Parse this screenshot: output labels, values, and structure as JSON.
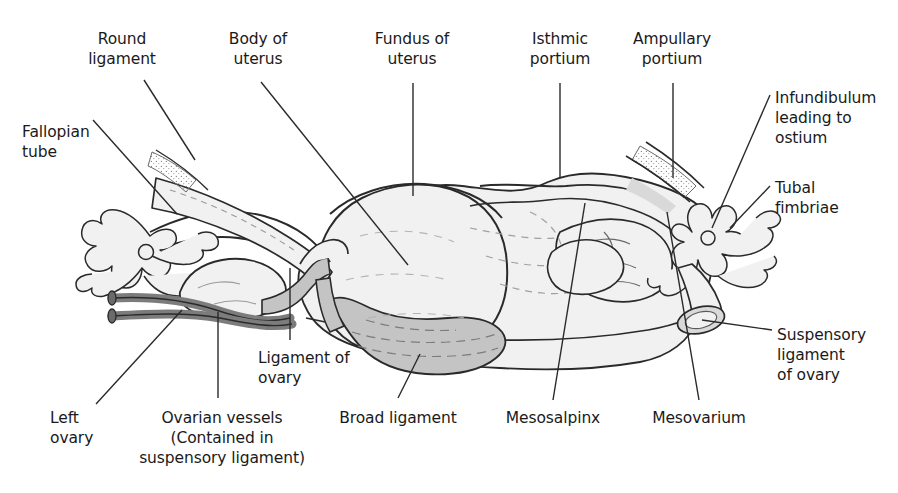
{
  "figure": {
    "background_color": "#ffffff",
    "ink_color": "#1a1a1a",
    "fills": {
      "organ_light": "#f1f1f1",
      "ligament_gray": "#c4c4c4",
      "vessel_dark": "#7c7c7c",
      "shade_mid": "#d9d9d9"
    }
  },
  "labels": {
    "round_ligament": "Round\nligament",
    "body_of_uterus": "Body of\nuterus",
    "fundus_of_uterus": "Fundus of\nuterus",
    "isthmic_portium": "Isthmic\nportium",
    "ampullary_portium": "Ampullary\nportium",
    "fallopian_tube": "Fallopian\ntube",
    "infundibulum": "Infundibulum\nleading to\nostium",
    "tubal_fimbriae": "Tubal\nfimbriae",
    "suspensory_ligament_of_ovary": "Suspensory\nligament\nof ovary",
    "ligament_of_ovary": "Ligament of\novary",
    "left_ovary": "Left\novary",
    "ovarian_vessels": "Ovarian vessels\n(Contained in\nsuspensory ligament)",
    "broad_ligament": "Broad ligament",
    "mesosalpinx": "Mesosalpinx",
    "mesovarium": "Mesovarium"
  },
  "label_positions": {
    "round_ligament": {
      "x": 122,
      "y": 29,
      "align": "center"
    },
    "body_of_uterus": {
      "x": 258,
      "y": 29,
      "align": "center"
    },
    "fundus_of_uterus": {
      "x": 412,
      "y": 29,
      "align": "center"
    },
    "isthmic_portium": {
      "x": 560,
      "y": 29,
      "align": "center"
    },
    "ampullary_portium": {
      "x": 672,
      "y": 29,
      "align": "center"
    },
    "fallopian_tube": {
      "x": 22,
      "y": 122,
      "align": "left"
    },
    "infundibulum": {
      "x": 775,
      "y": 88,
      "align": "left"
    },
    "tubal_fimbriae": {
      "x": 775,
      "y": 178,
      "align": "left"
    },
    "suspensory_ligament": {
      "x": 777,
      "y": 325,
      "align": "left"
    },
    "ligament_of_ovary": {
      "x": 258,
      "y": 348,
      "align": "left"
    },
    "left_ovary": {
      "x": 50,
      "y": 408,
      "align": "left"
    },
    "ovarian_vessels": {
      "x": 222,
      "y": 408,
      "align": "center"
    },
    "broad_ligament": {
      "x": 398,
      "y": 408,
      "align": "center"
    },
    "mesosalpinx": {
      "x": 553,
      "y": 408,
      "align": "center"
    },
    "mesovarium": {
      "x": 699,
      "y": 408,
      "align": "center"
    }
  },
  "leader_lines": [
    {
      "name": "round-ligament-leader",
      "points": "144,80 195,160"
    },
    {
      "name": "body-of-uterus-leader",
      "points": "261,82 408,265"
    },
    {
      "name": "fundus-of-uterus-leader",
      "points": "413,83 413,196"
    },
    {
      "name": "isthmic-portium-leader",
      "points": "560,83 560,178"
    },
    {
      "name": "ampullary-portium-leader",
      "points": "673,83 673,178"
    },
    {
      "name": "fallopian-tube-leader",
      "points": "93,120 177,214"
    },
    {
      "name": "infundibulum-leader",
      "points": "770,95 712,228"
    },
    {
      "name": "tubal-fimbriae-leader",
      "points": "770,186 730,228"
    },
    {
      "name": "suspensory-ligament-leader",
      "points": "772,330 702,320"
    },
    {
      "name": "ligament-of-ovary-leader",
      "points": "290,340 290,268"
    },
    {
      "name": "left-ovary-leader",
      "points": "96,404 182,310"
    },
    {
      "name": "ovarian-vessels-leader",
      "points": "218,398 218,312"
    },
    {
      "name": "broad-ligament-leader",
      "points": "398,398 420,354"
    },
    {
      "name": "mesosalpinx-leader",
      "points": "553,400 585,203"
    },
    {
      "name": "mesovarium-leader",
      "points": "699,400 667,212"
    }
  ]
}
